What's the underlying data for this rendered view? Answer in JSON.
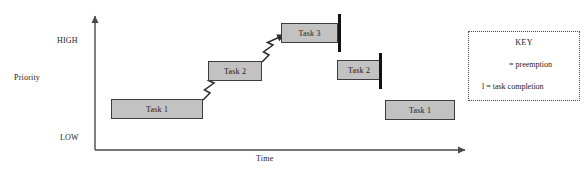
{
  "diagram": {
    "type": "priority-vs-time-scheduling",
    "axes": {
      "y_axis_title": "Priority",
      "y_high_label": "HIGH",
      "y_low_label": "LOW",
      "x_axis_title": "Time"
    },
    "tasks": [
      {
        "label": "Task 1",
        "x": 111,
        "y": 99,
        "width": 92,
        "height": 20,
        "completion": false
      },
      {
        "label": "Task 2",
        "x": 208,
        "y": 61,
        "width": 54,
        "height": 20,
        "completion": false
      },
      {
        "label": "Task 3",
        "x": 281,
        "y": 23,
        "width": 57,
        "height": 20,
        "completion": true
      },
      {
        "label": "Task 2",
        "x": 337,
        "y": 60,
        "width": 44,
        "height": 20,
        "completion": true
      },
      {
        "label": "Task 1",
        "x": 385,
        "y": 100,
        "width": 70,
        "height": 20,
        "completion": false
      }
    ],
    "completion_bars": [
      {
        "x": 338,
        "y": 14,
        "height": 38
      },
      {
        "x": 379,
        "y": 53,
        "height": 36
      }
    ],
    "preemption_arrows": [
      {
        "from_x": 203,
        "from_y": 99,
        "to_x": 230,
        "to_y": 82
      },
      {
        "from_x": 262,
        "from_y": 61,
        "to_x": 288,
        "to_y": 44
      }
    ],
    "colors": {
      "task_fill": "#c2c2c2",
      "task_border": "#3d3d3d",
      "completion_bar": "#121212",
      "axis": "#4a4a4a",
      "text": "#1a1a1a",
      "key_border": "#4a4a4a"
    }
  },
  "key": {
    "title": "KEY",
    "preemption_text": "= preemption",
    "completion_text": "l = task completion"
  }
}
